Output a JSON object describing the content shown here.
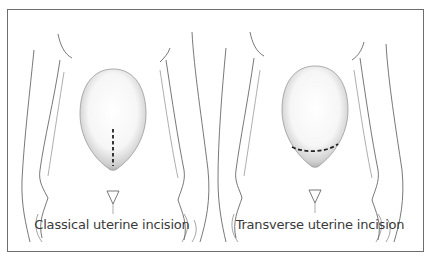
{
  "figure": {
    "panels": [
      {
        "id": "classical",
        "caption": "Classical uterine incision",
        "incision_orientation": "vertical"
      },
      {
        "id": "transverse",
        "caption": "Transverse uterine incision",
        "incision_orientation": "horizontal"
      }
    ],
    "colors": {
      "frame": "#6e6e6e",
      "outline": "#555555",
      "incision": "#222222",
      "uterus_shade": "#bdbdbd"
    }
  }
}
